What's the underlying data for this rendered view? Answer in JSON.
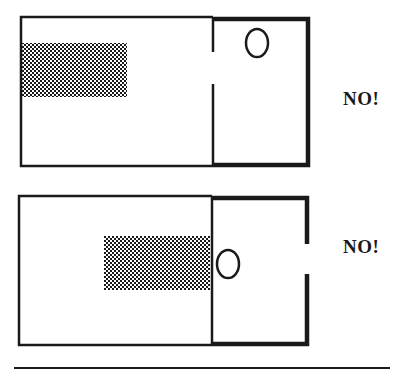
{
  "colors": {
    "ink": "#1a1a1a",
    "background": "#ffffff"
  },
  "panels": [
    {
      "id": "top",
      "label": "NO!",
      "label_pos": {
        "x": 343,
        "y": 98
      },
      "outer": {
        "x": 21,
        "y": 16,
        "w": 287,
        "h": 150
      },
      "divider_x": 213,
      "divider_gap": [
        52,
        84
      ],
      "right_wall_gap": null,
      "pattern": {
        "x": 21,
        "y": 43,
        "w": 106,
        "h": 54
      },
      "ellipse": {
        "cx": 257,
        "cy": 43,
        "rx": 11,
        "ry": 14
      }
    },
    {
      "id": "bottom",
      "label": "NO!",
      "label_pos": {
        "x": 343,
        "y": 246
      },
      "outer": {
        "x": 19,
        "y": 195,
        "w": 288,
        "h": 150
      },
      "divider_x": 212,
      "divider_gap": null,
      "right_wall_gap": [
        244,
        274
      ],
      "pattern": {
        "x": 104,
        "y": 236,
        "w": 106,
        "h": 54
      },
      "ellipse": {
        "cx": 228,
        "cy": 264,
        "rx": 11,
        "ry": 14
      }
    }
  ],
  "rule": {
    "x1": 14,
    "x2": 390,
    "y": 368
  }
}
